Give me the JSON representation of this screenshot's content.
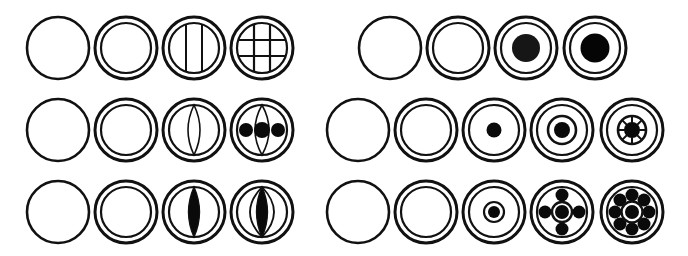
{
  "diagram": {
    "stroke_color": "#111111",
    "fill_color": "#0a0a0a",
    "background": "#ffffff",
    "outer_radius": 31,
    "inner_radius": 25,
    "panels": [
      {
        "name": "left-panel",
        "rows": [
          {
            "name": "row-1-grid",
            "cy": 48,
            "items": [
              {
                "cx": 58,
                "type": "plain"
              },
              {
                "cx": 126,
                "type": "double"
              },
              {
                "cx": 194,
                "type": "double-vlines"
              },
              {
                "cx": 262,
                "type": "double-grid"
              }
            ]
          },
          {
            "name": "row-2-lens-beads",
            "cy": 130,
            "items": [
              {
                "cx": 58,
                "type": "plain"
              },
              {
                "cx": 126,
                "type": "double"
              },
              {
                "cx": 194,
                "type": "double-lens"
              },
              {
                "cx": 262,
                "type": "double-lens-beads"
              }
            ]
          },
          {
            "name": "row-3-filled-lens",
            "cy": 212,
            "items": [
              {
                "cx": 58,
                "type": "plain"
              },
              {
                "cx": 126,
                "type": "double"
              },
              {
                "cx": 194,
                "type": "double-filled-lens"
              },
              {
                "cx": 262,
                "type": "double-filled-lens-arcs"
              }
            ]
          }
        ]
      },
      {
        "name": "right-panel",
        "rows": [
          {
            "name": "row-1-solid-core",
            "cy": 48,
            "items": [
              {
                "cx": 390,
                "type": "plain"
              },
              {
                "cx": 458,
                "type": "double"
              },
              {
                "cx": 526,
                "type": "double-core-large"
              },
              {
                "cx": 595,
                "type": "double-core-large-dark"
              }
            ]
          },
          {
            "name": "row-2-wheel",
            "cy": 130,
            "items": [
              {
                "cx": 358,
                "type": "plain"
              },
              {
                "cx": 426,
                "type": "double"
              },
              {
                "cx": 494,
                "type": "double-dot"
              },
              {
                "cx": 562,
                "type": "double-dot-ring"
              },
              {
                "cx": 632,
                "type": "double-wheel"
              }
            ]
          },
          {
            "name": "row-3-flower",
            "cy": 212,
            "items": [
              {
                "cx": 358,
                "type": "plain"
              },
              {
                "cx": 426,
                "type": "double"
              },
              {
                "cx": 494,
                "type": "double-dot-small-ring"
              },
              {
                "cx": 562,
                "type": "double-four-petals"
              },
              {
                "cx": 632,
                "type": "double-eight-petals"
              }
            ]
          }
        ]
      }
    ]
  }
}
